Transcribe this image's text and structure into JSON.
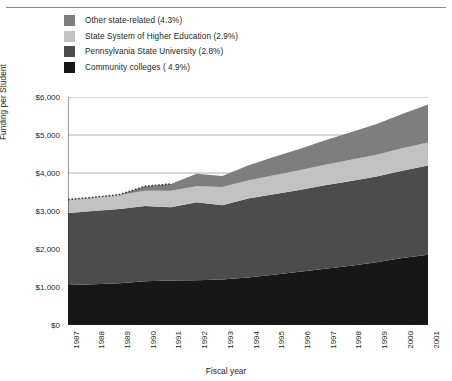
{
  "chart_data": {
    "type": "area",
    "stacked": true,
    "title": "",
    "xlabel": "Fiscal year",
    "ylabel": "Funding per Student",
    "ylim": [
      0,
      6000
    ],
    "ytick_labels": [
      "$6,000",
      "$5,000",
      "$4,000",
      "$3,000",
      "$2,000",
      "$1,000",
      "$0"
    ],
    "ytick_values": [
      6000,
      5000,
      4000,
      3000,
      2000,
      1000,
      0
    ],
    "grid": true,
    "legend_position": "top-left",
    "categories": [
      1987,
      1988,
      1989,
      1990,
      1991,
      1992,
      1993,
      1994,
      1995,
      1996,
      1997,
      1998,
      1999,
      2000,
      2001
    ],
    "xtick_labels": [
      "1987",
      "1988",
      "1989",
      "1990",
      "1991",
      "1992",
      "1993",
      "1994",
      "1995",
      "1996",
      "1997",
      "1998",
      "1999",
      "2000",
      "2001"
    ],
    "series": [
      {
        "name": "Community colleges ( 4.9%)",
        "color": "#171717",
        "stack_order": 1,
        "values": [
          1050,
          1070,
          1100,
          1150,
          1170,
          1180,
          1200,
          1250,
          1320,
          1400,
          1480,
          1560,
          1650,
          1760,
          1850
        ]
      },
      {
        "name": "Pennsylvania State University (2.8%)",
        "color": "#4c4c4c",
        "stack_order": 2,
        "values": [
          1900,
          1930,
          1950,
          1980,
          1930,
          2050,
          1950,
          2080,
          2120,
          2150,
          2200,
          2230,
          2260,
          2300,
          2350
        ]
      },
      {
        "name": "State System of Higher Education (2.9%)",
        "color": "#c2c2c2",
        "stack_order": 3,
        "values": [
          350,
          360,
          370,
          400,
          430,
          420,
          480,
          470,
          500,
          520,
          540,
          560,
          570,
          590,
          600
        ]
      },
      {
        "name": "Other state-related (4.3%)",
        "color": "#7e7e7e",
        "stack_order": 4,
        "values": [
          0,
          0,
          10,
          120,
          180,
          330,
          290,
          400,
          480,
          560,
          640,
          720,
          810,
          900,
          1000
        ]
      }
    ],
    "cumulative_totals": [
      3300,
      3360,
      3430,
      3650,
      3710,
      3980,
      3920,
      4200,
      4420,
      4630,
      4860,
      5070,
      5290,
      5550,
      5800
    ],
    "annotation": "Dotted top edge on the uppermost band for fiscal years 1987-1990 where the Other state-related share is negligible."
  },
  "legend": {
    "items": [
      {
        "label": "Other state-related (4.3%)",
        "color": "#7e7e7e",
        "swatch_name": "legend-swatch-other-state-related"
      },
      {
        "label": "State System of Higher Education (2.9%)",
        "color": "#c2c2c2",
        "swatch_name": "legend-swatch-state-system"
      },
      {
        "label": "Pennsylvania State University (2.8%)",
        "color": "#4c4c4c",
        "swatch_name": "legend-swatch-penn-state"
      },
      {
        "label": "Community colleges ( 4.9%)",
        "color": "#171717",
        "swatch_name": "legend-swatch-community-colleges"
      }
    ]
  },
  "axes": {
    "y_title": "Funding per Student",
    "x_title": "Fiscal year"
  },
  "colors": {
    "axis": "#231f20",
    "grid": "#9a9a9a",
    "rule": "#8b8b8b",
    "background": "#ffffff"
  }
}
